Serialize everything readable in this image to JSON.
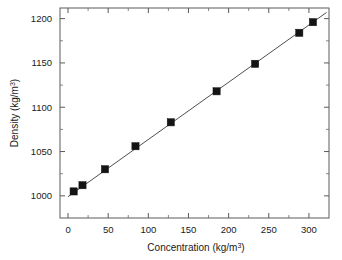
{
  "chart_data": {
    "type": "scatter",
    "title": "",
    "xlabel": "Concentration (kg/m3)",
    "xlabel_base": "Concentration (kg/m",
    "xlabel_sup": "3",
    "xlabel_tail": ")",
    "ylabel": "Density (kg/m3)",
    "ylabel_base": "Density (kg/m",
    "ylabel_sup": "3",
    "ylabel_tail": ")",
    "xlim": [
      -10,
      325
    ],
    "ylim": [
      975,
      1212
    ],
    "xticks": [
      0,
      50,
      100,
      150,
      200,
      250,
      300
    ],
    "yticks": [
      1000,
      1050,
      1100,
      1150,
      1200
    ],
    "x_minor_interval": 25,
    "y_minor_interval": 25,
    "grid": false,
    "legend": false,
    "marker_style": "filled-square",
    "marker_color": "#141414",
    "line_color": "#3a3a3a",
    "frame_color": "#5a5a5a",
    "x": [
      7,
      18,
      46,
      84,
      128,
      185,
      233,
      288,
      305
    ],
    "y": [
      1005,
      1012,
      1030,
      1056,
      1083,
      1118,
      1149,
      1184,
      1196
    ],
    "series": [
      {
        "name": "Density vs Concentration",
        "points": [
          {
            "x": 7,
            "y": 1005
          },
          {
            "x": 18,
            "y": 1012
          },
          {
            "x": 46,
            "y": 1030
          },
          {
            "x": 84,
            "y": 1056
          },
          {
            "x": 128,
            "y": 1083
          },
          {
            "x": 185,
            "y": 1118
          },
          {
            "x": 233,
            "y": 1149
          },
          {
            "x": 288,
            "y": 1184
          },
          {
            "x": 305,
            "y": 1196
          }
        ]
      }
    ],
    "fit_line": {
      "x_start": 0,
      "y_start": 999,
      "x_end": 322,
      "y_end": 1207
    }
  },
  "axis": {
    "x_tick_labels": [
      "0",
      "50",
      "100",
      "150",
      "200",
      "250",
      "300"
    ],
    "y_tick_labels": [
      "1000",
      "1050",
      "1100",
      "1150",
      "1200"
    ]
  }
}
